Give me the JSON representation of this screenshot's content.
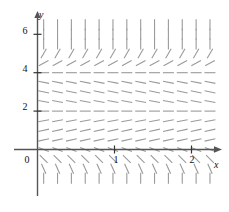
{
  "figure": {
    "kind": "slope-field",
    "background": "#ffffff",
    "width": 229,
    "height": 212
  },
  "axes": {
    "x_axis_label": "x",
    "y_axis_label": "y",
    "axis_color": "#555555",
    "tick_color": "#333333",
    "x_ticks": [
      {
        "value": 1,
        "label": "1"
      },
      {
        "value": 2,
        "label": "2"
      }
    ],
    "y_ticks": [
      {
        "value": 2,
        "label": "2"
      },
      {
        "value": 4,
        "label": "4"
      },
      {
        "value": 6,
        "label": "6"
      }
    ],
    "origin_label": "0",
    "x_range": [
      -0.1,
      2.45
    ],
    "y_range": [
      -1.75,
      7.0
    ],
    "grid": false
  },
  "chart_data": {
    "type": "scatter",
    "title": "",
    "xlabel": "x",
    "ylabel": "y",
    "xlim": [
      -0.1,
      2.45
    ],
    "ylim": [
      -1.75,
      7.0
    ],
    "grid": false,
    "legend": null,
    "field": {
      "description": "Direction field of an autonomous differential equation; slope depends only on y.",
      "segment_color": "#9a9a9a",
      "segment_length_px": 11,
      "x_samples": [
        0.08,
        0.26,
        0.44,
        0.62,
        0.8,
        0.98,
        1.16,
        1.34,
        1.52,
        1.7,
        1.88,
        2.06,
        2.24
      ],
      "y_samples": [
        -1.5,
        -1.0,
        -0.5,
        0.0,
        0.5,
        1.0,
        1.5,
        2.0,
        2.5,
        3.0,
        3.5,
        4.0,
        4.5,
        5.0,
        5.5,
        6.0,
        6.5
      ],
      "slope_by_y": [
        {
          "y": -1.5,
          "slope": -14.0
        },
        {
          "y": -1.0,
          "slope": -9.0
        },
        {
          "y": -0.5,
          "slope": -4.0
        },
        {
          "y": 0.0,
          "slope": -1.6
        },
        {
          "y": 0.5,
          "slope": 0.9
        },
        {
          "y": 1.0,
          "slope": 0.9
        },
        {
          "y": 1.5,
          "slope": 0.75
        },
        {
          "y": 2.0,
          "slope": 0.0
        },
        {
          "y": 2.5,
          "slope": -0.7
        },
        {
          "y": 3.0,
          "slope": -0.85
        },
        {
          "y": 3.5,
          "slope": -0.8
        },
        {
          "y": 4.0,
          "slope": 0.0
        },
        {
          "y": 4.5,
          "slope": 2.2
        },
        {
          "y": 5.0,
          "slope": 7.0
        },
        {
          "y": 5.5,
          "slope": 14.0
        },
        {
          "y": 6.0,
          "slope": 20.0
        },
        {
          "y": 6.5,
          "slope": 26.0
        }
      ],
      "equilibria": [
        {
          "y": 2,
          "note": "slope zero, horizontal dashes"
        },
        {
          "y": 4,
          "note": "slope zero, horizontal dashes"
        }
      ]
    }
  }
}
